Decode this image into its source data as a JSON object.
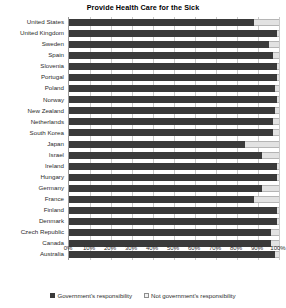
{
  "chart_data": {
    "type": "bar",
    "orientation": "horizontal",
    "stacked": true,
    "title": "Provide Health Care for the Sick",
    "xlabel": "",
    "ylabel": "",
    "xlim": [
      0,
      100
    ],
    "grid": true,
    "legend_position": "bottom",
    "tick_labels": [
      "0%",
      "10%",
      "20%",
      "30%",
      "40%",
      "50%",
      "60%",
      "70%",
      "80%",
      "90%",
      "100%"
    ],
    "tick_values": [
      0,
      10,
      20,
      30,
      40,
      50,
      60,
      70,
      80,
      90,
      100
    ],
    "categories": [
      "United States",
      "United Kingdom",
      "Sweden",
      "Spain",
      "Slovenia",
      "Portugal",
      "Poland",
      "Norway",
      "New Zealand",
      "Netherlands",
      "South Korea",
      "Japan",
      "Israel",
      "Ireland",
      "Hungary",
      "Germany",
      "France",
      "Finland",
      "Denmark",
      "Czech Republic",
      "Canada",
      "Australia"
    ],
    "series": [
      {
        "name": "Government's responsibility",
        "color": "#3a3a3a",
        "values": [
          88,
          99,
          95,
          97,
          99,
          99,
          98,
          99,
          98,
          97,
          97,
          84,
          92,
          99,
          99,
          92,
          88,
          99,
          99,
          96,
          96,
          98
        ]
      },
      {
        "name": "Not government's responsibility",
        "color": "#e2e2e2",
        "values": [
          12,
          1,
          5,
          3,
          1,
          1,
          2,
          1,
          2,
          3,
          3,
          16,
          8,
          1,
          1,
          8,
          12,
          1,
          1,
          4,
          4,
          2
        ]
      }
    ]
  },
  "legend": {
    "items": [
      {
        "label": "Government's responsibility"
      },
      {
        "label": "Not government's responsibility"
      }
    ]
  }
}
